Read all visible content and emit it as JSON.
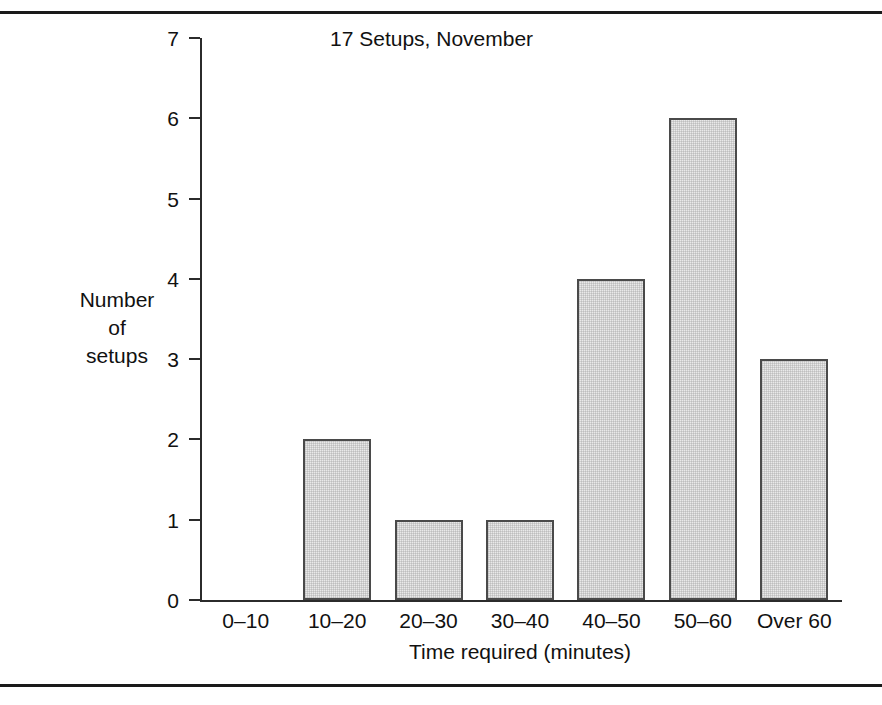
{
  "figure": {
    "rule_color": "#1a1a1a",
    "has_top_rule": true,
    "has_bottom_rule": true
  },
  "chart_data": {
    "type": "bar",
    "title": "17 Setups, November",
    "xlabel": "Time required (minutes)",
    "ylabel_lines": [
      "Number",
      "of",
      "setups"
    ],
    "ylabel": "Number of setups",
    "categories": [
      "0–10",
      "10–20",
      "20–30",
      "30–40",
      "40–50",
      "50–60",
      "Over 60"
    ],
    "values": [
      0,
      2,
      1,
      1,
      4,
      6,
      3
    ],
    "ylim": [
      0,
      7
    ],
    "yticks": [
      0,
      1,
      2,
      3,
      4,
      5,
      6,
      7
    ],
    "ytick_labels": [
      "0",
      "1",
      "2",
      "3",
      "4",
      "5",
      "6",
      "7"
    ],
    "grid": false,
    "legend": null,
    "total_setups": 17,
    "bar_fill_color": "#e9e9e9",
    "bar_edge_color": "#4a4a4a",
    "axis_color": "#2b2b2b"
  }
}
